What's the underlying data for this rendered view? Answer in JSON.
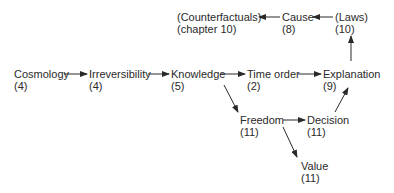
{
  "nodes": {
    "counterfactuals": {
      "label": "(Counterfactuals)",
      "sub": "(chapter 10)"
    },
    "cause": {
      "label": "Cause",
      "sub": "(8)"
    },
    "laws": {
      "label": "(Laws)",
      "sub": "(10)"
    },
    "cosmology": {
      "label": "Cosmology",
      "sub": "(4)"
    },
    "irreversibility": {
      "label": "Irreversibility",
      "sub": "(4)"
    },
    "knowledge": {
      "label": "Knowledge",
      "sub": "(5)"
    },
    "time_order": {
      "label": "Time order",
      "sub": "(2)"
    },
    "explanation": {
      "label": "Explanation",
      "sub": "(9)"
    },
    "freedom": {
      "label": "Freedom",
      "sub": "(11)"
    },
    "decision": {
      "label": "Decision",
      "sub": "(11)"
    },
    "value": {
      "label": "Value",
      "sub": "(11)"
    }
  },
  "edges": [
    [
      "cosmology",
      "irreversibility"
    ],
    [
      "irreversibility",
      "knowledge"
    ],
    [
      "knowledge",
      "time_order"
    ],
    [
      "time_order",
      "explanation"
    ],
    [
      "knowledge",
      "freedom"
    ],
    [
      "freedom",
      "decision"
    ],
    [
      "freedom",
      "value"
    ],
    [
      "decision",
      "explanation"
    ],
    [
      "explanation",
      "laws"
    ],
    [
      "laws",
      "cause"
    ],
    [
      "cause",
      "counterfactuals"
    ]
  ],
  "colors": {
    "ink": "#2a2a2a",
    "background": "#ffffff"
  }
}
